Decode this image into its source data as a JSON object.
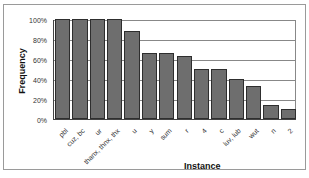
{
  "chart_data": {
    "type": "bar",
    "title": "",
    "xlabel": "Instance",
    "ylabel": "Frequency",
    "ylim": [
      0,
      100
    ],
    "yticks": [
      "0%",
      "20%",
      "40%",
      "60%",
      "80%",
      "100%"
    ],
    "grid": true,
    "legend": null,
    "categories": [
      "pbl",
      "cuz, bc",
      "ur",
      "thanx, thnx, thx",
      "u",
      "y",
      "sum",
      "r",
      "4",
      "c",
      "luv, lub",
      "wut",
      "n",
      "2"
    ],
    "values": [
      100,
      100,
      100,
      100,
      88,
      66,
      66,
      63,
      50,
      50,
      40,
      33,
      14,
      10
    ],
    "bar_color": "#6e6e6e"
  }
}
